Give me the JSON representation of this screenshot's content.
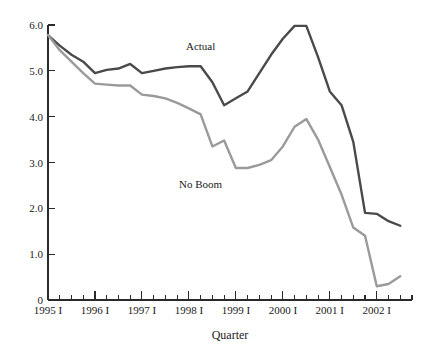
{
  "chart_data": {
    "type": "line",
    "title": "",
    "xlabel": "Quarter",
    "ylabel": "",
    "grid": false,
    "legend_position": "inline-annotation",
    "ylim": [
      0,
      6.0
    ],
    "ytick_values": [
      0,
      1.0,
      2.0,
      3.0,
      4.0,
      5.0,
      6.0
    ],
    "ytick_labels": [
      "0",
      "1.0",
      "2.0",
      "3.0",
      "4.0",
      "5.0",
      "6.0"
    ],
    "xtick_labels": [
      "1995 I",
      "1996 I",
      "1997 I",
      "1998 I",
      "1999 I",
      "2000 I",
      "2001 I",
      "2002 I"
    ],
    "x_major_indices": [
      0,
      4,
      8,
      12,
      16,
      20,
      24,
      28
    ],
    "x_minor_count": 31,
    "x": [
      "1995 I",
      "1995 II",
      "1995 III",
      "1995 IV",
      "1996 I",
      "1996 II",
      "1996 III",
      "1996 IV",
      "1997 I",
      "1997 II",
      "1997 III",
      "1997 IV",
      "1998 I",
      "1998 II",
      "1998 III",
      "1998 IV",
      "1999 I",
      "1999 II",
      "1999 III",
      "1999 IV",
      "2000 I",
      "2000 II",
      "2000 III",
      "2000 IV",
      "2001 I",
      "2001 II",
      "2001 III",
      "2001 IV",
      "2002 I",
      "2002 II",
      "2002 III"
    ],
    "series": [
      {
        "name": "Actual",
        "color": "#4a4a4a",
        "label_x_index": 13,
        "label_y_value": 5.45,
        "values": [
          5.78,
          5.55,
          5.35,
          5.2,
          4.95,
          5.02,
          5.05,
          5.15,
          4.95,
          5.0,
          5.05,
          5.08,
          5.1,
          5.1,
          4.75,
          4.25,
          4.4,
          4.55,
          4.95,
          5.35,
          5.7,
          5.98,
          5.98,
          5.3,
          4.55,
          4.25,
          3.45,
          1.9,
          1.88,
          1.72,
          1.62
        ]
      },
      {
        "name": "No Boom",
        "color": "#9a9a9a",
        "label_x_index": 13,
        "label_y_value": 2.45,
        "values": [
          5.78,
          5.45,
          5.2,
          4.95,
          4.72,
          4.7,
          4.68,
          4.68,
          4.48,
          4.45,
          4.4,
          4.3,
          4.18,
          4.05,
          3.35,
          3.48,
          2.88,
          2.88,
          2.95,
          3.05,
          3.35,
          3.78,
          3.95,
          3.5,
          2.9,
          2.3,
          1.58,
          1.4,
          0.3,
          0.35,
          0.52
        ]
      }
    ]
  },
  "axis": {
    "x_label": "Quarter"
  }
}
